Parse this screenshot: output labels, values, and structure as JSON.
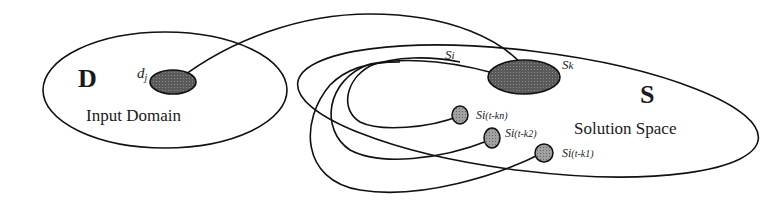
{
  "diagram": {
    "input_domain": {
      "symbol": "D",
      "label": "Input Domain",
      "element": "d",
      "element_sub": "j"
    },
    "solution_space": {
      "symbol": "S",
      "label": "Solution Space",
      "target": "S",
      "target_sub": "k",
      "current": "S",
      "current_sub": "i",
      "previous": [
        {
          "base": "S",
          "sub": "i",
          "paren": "(t-kn)"
        },
        {
          "base": "S",
          "sub": "i",
          "paren": "(t-k2)"
        },
        {
          "base": "S",
          "sub": "i",
          "paren": "(t-k1)"
        }
      ]
    },
    "colors": {
      "stroke": "#111111",
      "dark_fill": "#4a4a4a",
      "light_fill": "#9a9a9a"
    }
  }
}
